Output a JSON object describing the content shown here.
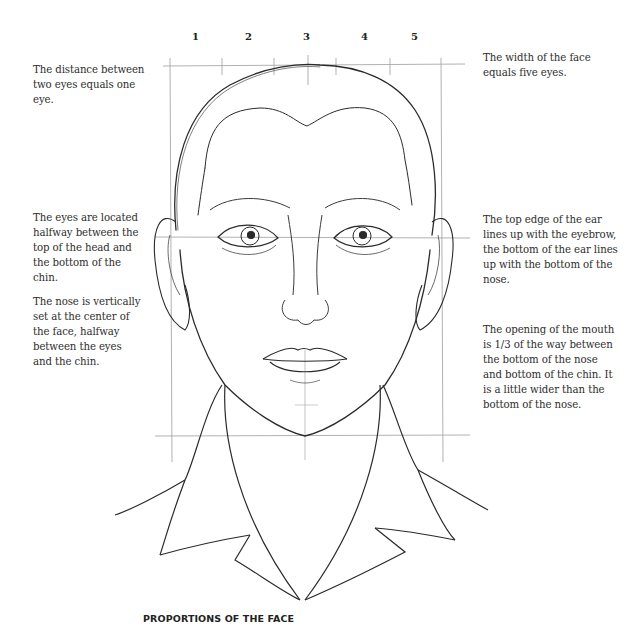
{
  "title": "PROPORTIONS OF THE FACE",
  "eye_units": [
    "1",
    "2",
    "3",
    "4",
    "5"
  ],
  "notes": {
    "eye_distance": "The distance between two eyes equals one eye.",
    "face_width": "The width of the face equals five eyes.",
    "eye_position": "The eyes are located halfway between the top of the head and the bottom of the chin.",
    "ear_position": "The top edge of the ear lines up with the eyebrow, the bottom of the ear lines up with the bottom of the nose.",
    "nose_position": "The nose is vertically set at the center of the face, halfway between the eyes and the chin.",
    "mouth_position": "The opening of the mouth is 1/3 of the way between the bottom of the nose and bottom of the chin. It is a little wider than the bottom of the nose."
  },
  "colors": {
    "ink": "#2a2a2a",
    "guide": "#9a9a9a",
    "background": "#ffffff"
  }
}
